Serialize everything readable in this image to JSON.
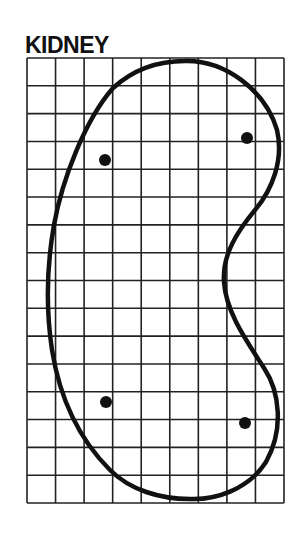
{
  "title": "KIDNEY",
  "grid": {
    "columns": 9,
    "rows": 16,
    "left": 27,
    "top": 58,
    "right": 284,
    "bottom": 503,
    "line_color": "#222222"
  },
  "outline": {
    "shape": "kidney",
    "stroke_color": "#111111",
    "stroke_width": 4.5
  },
  "markers": [
    {
      "label": "upper-left-dot",
      "cx": 105,
      "cy": 160
    },
    {
      "label": "upper-right-dot",
      "cx": 247,
      "cy": 138
    },
    {
      "label": "lower-left-dot",
      "cx": 106,
      "cy": 402
    },
    {
      "label": "lower-right-dot",
      "cx": 245,
      "cy": 423
    }
  ],
  "marker_color": "#111111"
}
